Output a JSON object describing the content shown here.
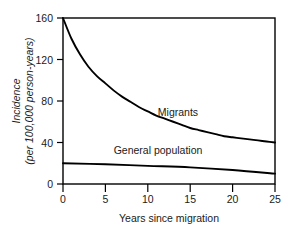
{
  "chart_data": {
    "type": "line",
    "title": "",
    "xlabel": "Years since migration",
    "ylabel": "Incidence (per 100,000 person-years)",
    "ylabel_line1": "Incidence",
    "ylabel_line2": "(per 100,000 person-years)",
    "xlim": [
      0,
      25
    ],
    "ylim": [
      0,
      160
    ],
    "xticks": [
      0,
      5,
      10,
      15,
      20,
      25
    ],
    "xtick_labels": [
      "0",
      "5",
      "10",
      "15",
      "20",
      "25"
    ],
    "yticks": [
      0,
      40,
      80,
      120,
      160
    ],
    "ytick_labels": [
      "0",
      "40",
      "80",
      "120",
      "160"
    ],
    "grid": false,
    "legend_position": "inline-annotations",
    "series": [
      {
        "name": "Migrants",
        "label": "Migrants",
        "x": [
          0,
          1,
          2,
          3,
          4,
          5,
          6,
          7,
          8,
          9,
          10,
          11,
          12,
          13,
          14,
          15,
          16,
          17,
          18,
          19,
          20,
          21,
          22,
          23,
          24,
          25
        ],
        "values": [
          160,
          140,
          125,
          113,
          104,
          97,
          90,
          84,
          79,
          74,
          70,
          66,
          63,
          60,
          57,
          54,
          52,
          50,
          48,
          46,
          45,
          44,
          43,
          42,
          41,
          40
        ]
      },
      {
        "name": "General population",
        "label": "General population",
        "x": [
          0,
          5,
          10,
          15,
          20,
          25
        ],
        "values": [
          20,
          19,
          17.5,
          16,
          13.5,
          10
        ]
      }
    ],
    "annotations": [
      {
        "text": "Migrants",
        "x": 13.5,
        "y": 62
      },
      {
        "text": "General population",
        "x": 9.5,
        "y": 29
      }
    ],
    "colors": {
      "axis": "#000000",
      "migrants_line": "#000000",
      "general_population_line": "#000000",
      "background": "#ffffff",
      "text": "#1a1a1a"
    }
  }
}
